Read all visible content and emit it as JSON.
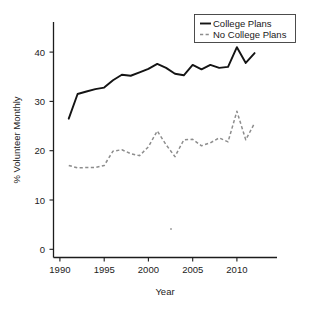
{
  "chart_data": {
    "type": "line",
    "title": "",
    "xlabel": "Year",
    "ylabel": "% Volunteer Monthly",
    "xlim": [
      1989.5,
      2013.0
    ],
    "ylim": [
      0,
      45
    ],
    "xticks": [
      1990,
      1995,
      2000,
      2005,
      2010
    ],
    "xtick_labels": [
      "1990",
      "1995",
      "2000",
      "2005",
      "2010"
    ],
    "yticks": [
      0,
      10,
      20,
      30,
      40
    ],
    "ytick_labels": [
      "0",
      "10",
      "20",
      "30",
      "40"
    ],
    "grid": false,
    "legend_position": "top-right",
    "x": [
      1991,
      1992,
      1993,
      1994,
      1995,
      1996,
      1997,
      1998,
      1999,
      2000,
      2001,
      2002,
      2003,
      2004,
      2005,
      2006,
      2007,
      2008,
      2009,
      2010,
      2011,
      2012
    ],
    "series": [
      {
        "name": "College Plans",
        "style": "solid",
        "color": "#141414",
        "values": [
          26.5,
          31.5,
          32.0,
          32.5,
          32.8,
          34.3,
          35.4,
          35.2,
          35.9,
          36.6,
          37.6,
          36.8,
          35.6,
          35.3,
          37.4,
          36.5,
          37.4,
          36.8,
          37.0,
          41.0,
          37.8,
          39.8
        ]
      },
      {
        "name": "No College Plans",
        "style": "dashed",
        "color": "#8d8d8d",
        "values": [
          17.0,
          16.5,
          16.6,
          16.6,
          17.0,
          19.9,
          20.2,
          19.4,
          19.0,
          20.8,
          24.0,
          21.2,
          18.8,
          22.2,
          22.3,
          21.0,
          21.6,
          22.6,
          21.8,
          28.0,
          22.2,
          25.6
        ]
      }
    ]
  },
  "legend": {
    "entries": [
      {
        "label": "College Plans"
      },
      {
        "label": "No College Plans"
      }
    ]
  },
  "axes": {
    "x_title": "Year",
    "y_title": "% Volunteer Monthly"
  }
}
